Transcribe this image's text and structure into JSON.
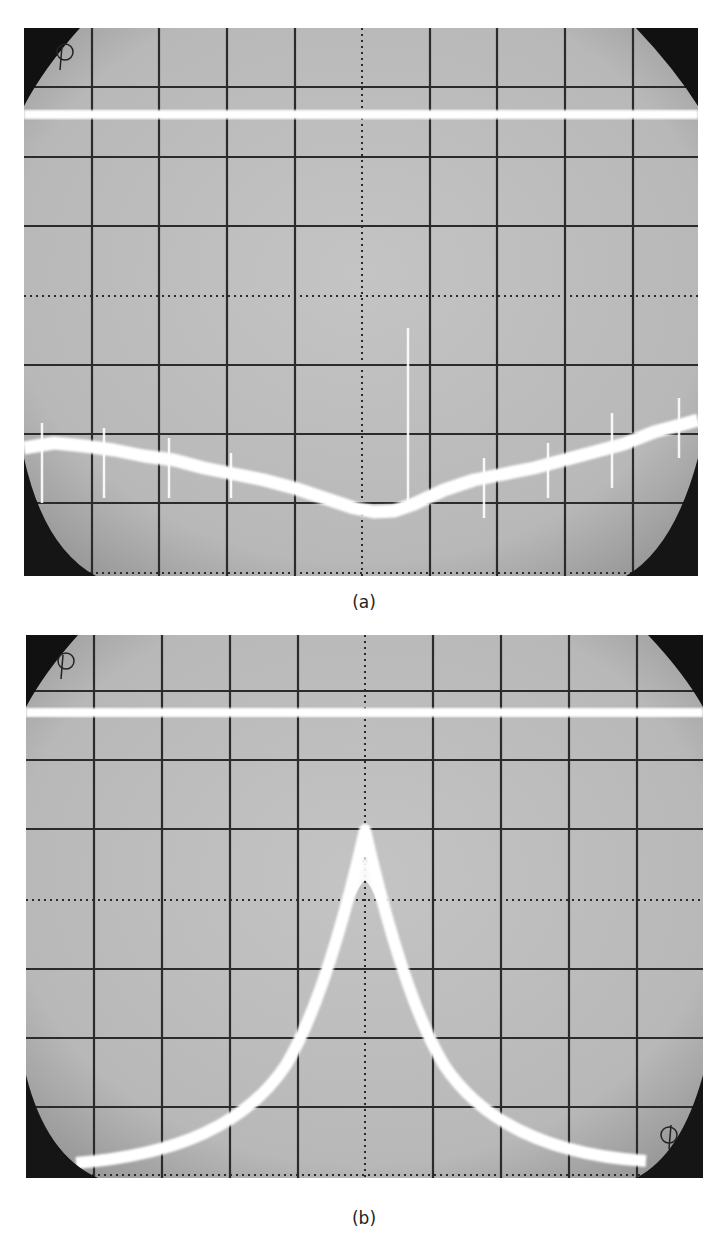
{
  "figure": {
    "panels": [
      {
        "id": "a",
        "caption": "(a)",
        "description": "Oscilloscope trace: flat upper baseline and lower noisy V-shaped dip with vertical spikes",
        "grid": {
          "divisions_x": 10,
          "divisions_y": 8
        },
        "trace_colors": {
          "screen": "#bdbdbd",
          "trace": "#ffffff",
          "grid": "#2b2b2b",
          "mask": "#111111"
        }
      },
      {
        "id": "b",
        "caption": "(b)",
        "description": "Oscilloscope trace: flat upper baseline and lower sharp cusp-shaped resonance peak with small central notch",
        "grid": {
          "divisions_x": 10,
          "divisions_y": 8
        },
        "trace_colors": {
          "screen": "#bdbdbd",
          "trace": "#ffffff",
          "grid": "#2b2b2b",
          "mask": "#111111"
        }
      }
    ]
  }
}
